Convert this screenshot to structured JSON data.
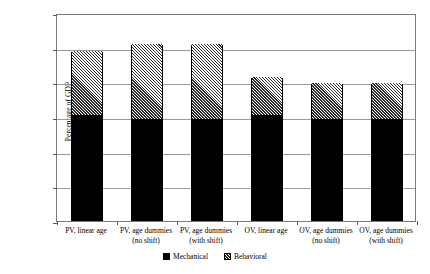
{
  "chart_data": {
    "type": "bar",
    "stacked": true,
    "title": "",
    "xlabel": "",
    "ylabel": "Percentage of GDP",
    "ylim": [
      0.0,
      0.06
    ],
    "ytick_labels": [
      "0.06%",
      "0.05%",
      "0.04%",
      "0.03%",
      "0.02%",
      "0.01%",
      "0.00%"
    ],
    "ytick_values": [
      0.06,
      0.05,
      0.04,
      0.03,
      0.02,
      0.01,
      0.0
    ],
    "grid": true,
    "legend_position": "bottom-center",
    "categories": [
      "PV, linear age",
      "PV, age dummies (no shift)",
      "PV, age dummies (with shift)",
      "OV, linear age",
      "OV, age dummies (no shift)",
      "OV, age dummies (with shift)"
    ],
    "category_lines": [
      [
        "PV, linear age",
        ""
      ],
      [
        "PV, age dummies",
        "(no shift)"
      ],
      [
        "PV, age dummies",
        "(with shift)"
      ],
      [
        "OV, linear age",
        ""
      ],
      [
        "OV, age dummies",
        "(no shift)"
      ],
      [
        "OV, age dummies",
        "(with shift)"
      ]
    ],
    "series": [
      {
        "name": "Mechanical",
        "color": "#000000",
        "pattern": "solid",
        "values": [
          0.03,
          0.0288,
          0.0288,
          0.03,
          0.0288,
          0.0288
        ]
      },
      {
        "name": "Behavioral",
        "color": "#2b2b2b",
        "pattern": "diagonal-hatch",
        "values": [
          0.0187,
          0.022,
          0.022,
          0.0112,
          0.0107,
          0.0107
        ]
      }
    ],
    "totals": [
      0.0487,
      0.0508,
      0.0508,
      0.0412,
      0.0395,
      0.0395
    ]
  },
  "legend": {
    "items": [
      {
        "label": "Mechanical",
        "swatch": "solid-black-square-icon"
      },
      {
        "label": "Behavioral",
        "swatch": "hatched-square-icon"
      }
    ]
  }
}
